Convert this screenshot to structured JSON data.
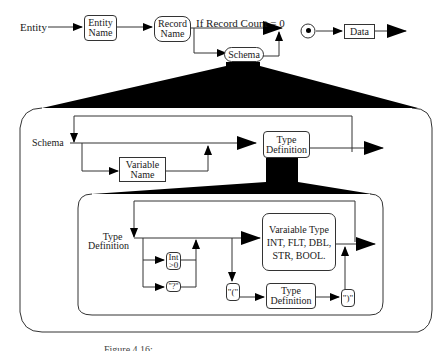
{
  "diagram": {
    "top_row": {
      "entity_label": "Entity",
      "entity_name_box": [
        "Entity",
        "Name"
      ],
      "record_name_box": [
        "Record",
        "Name"
      ],
      "condition_label": "If Record Count = 0",
      "data_box": "Data",
      "schema_pill": "Schema"
    },
    "schema_panel": {
      "schema_label": "Schema",
      "variable_name_box": [
        "Variable",
        "Name"
      ],
      "type_definition_box": [
        "Type",
        "Definition"
      ]
    },
    "type_definition_panel": {
      "type_definition_label": [
        "Type",
        "Definition"
      ],
      "int_box": [
        "Int",
        ">0"
      ],
      "question_box": "\"?\"",
      "open_paren_box": "\"(\"",
      "nested_type_definition_box": [
        "Type",
        "Definition"
      ],
      "close_paren_box": "\")\"",
      "variable_type_box": {
        "title": "Varaiable Type",
        "line1": "INT, FLT, DBL,",
        "line2": "STR, BOOL."
      }
    },
    "caption_fragment": "Figure 4.16: ..."
  },
  "colors": {
    "line": "#333333",
    "fill": "#000000",
    "background": "#ffffff"
  }
}
